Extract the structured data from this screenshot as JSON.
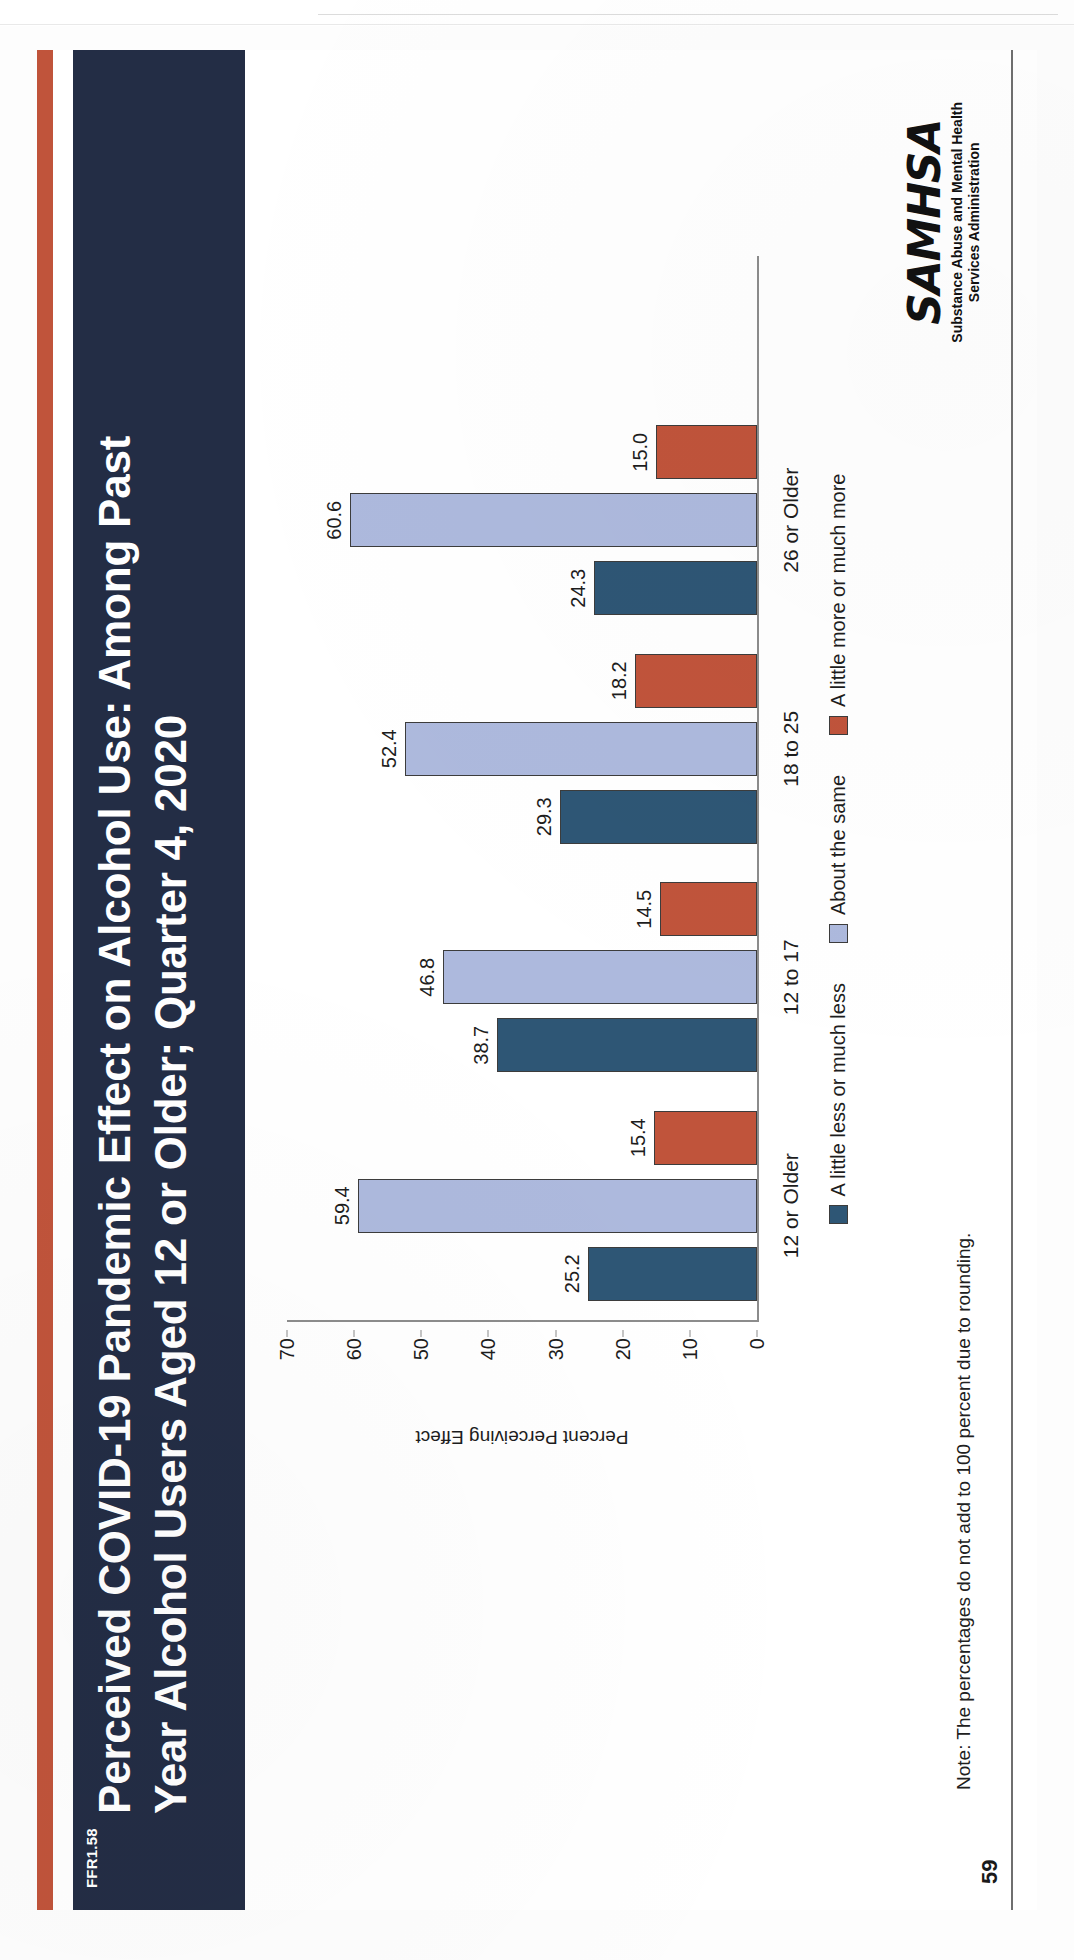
{
  "slide": {
    "ffr_tag": "FFR1.58",
    "title": "Perceived COVID-19 Pandemic Effect on Alcohol Use: Among Past\nYear Alcohol Users Aged 12 or Older; Quarter 4, 2020",
    "page_number": "59",
    "note": "Note: The percentages do not add to 100 percent due to rounding.",
    "logo": {
      "wordmark": "SAMHSA",
      "subtitle_line1": "Substance Abuse and Mental Health",
      "subtitle_line2": "Services Administration"
    },
    "colors": {
      "title_bar": "#232d45",
      "accent_bar": "#c0543b",
      "series_less": "#2e5675",
      "series_same": "#adb9dd",
      "series_more": "#c0543b"
    }
  },
  "chart_data": {
    "type": "bar",
    "title": "",
    "xlabel": "",
    "ylabel": "Percent Perceiving Effect",
    "ylim": [
      0,
      70
    ],
    "yticks": [
      "0",
      "10",
      "20",
      "30",
      "40",
      "50",
      "60",
      "70"
    ],
    "grid": false,
    "legend_position": "bottom",
    "categories": [
      "12 or Older",
      "12 to 17",
      "18 to 25",
      "26 or Older"
    ],
    "series": [
      {
        "name": "A little less or much less",
        "color": "#2e5675",
        "values": [
          25.2,
          38.7,
          29.3,
          24.3
        ],
        "labels": [
          "25.2",
          "38.7",
          "29.3",
          "24.3"
        ]
      },
      {
        "name": "About the same",
        "color": "#adb9dd",
        "values": [
          59.4,
          46.8,
          52.4,
          60.6
        ],
        "labels": [
          "59.4",
          "46.8",
          "52.4",
          "60.6"
        ]
      },
      {
        "name": "A little more or much more",
        "color": "#c0543b",
        "values": [
          15.4,
          14.5,
          18.2,
          15.0
        ],
        "labels": [
          "15.4",
          "14.5",
          "18.2",
          "15.0"
        ]
      }
    ]
  }
}
